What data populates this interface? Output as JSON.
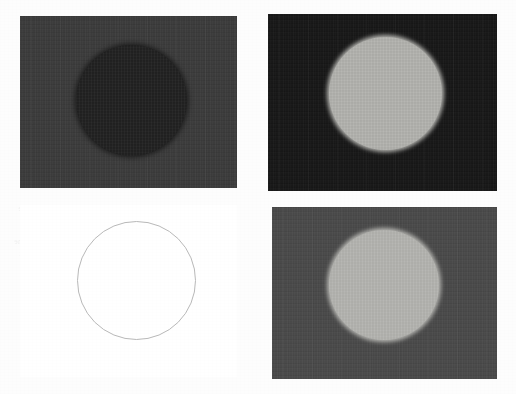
{
  "document": {
    "kind": "scanned-figure-sheet",
    "page_background": "#fdfdfd",
    "width": 516,
    "height": 394,
    "layout": "2x2 panel grid"
  },
  "panels": [
    {
      "id": "top-left",
      "name": "panel-top-left",
      "description": "Dark gray photographic panel containing a darker circular disc",
      "x": 20,
      "y": 16,
      "width": 217,
      "height": 172,
      "background_color": "#3c3c3c",
      "disc": {
        "name": "dark-disc",
        "fill_color": "#232323",
        "cx": 131,
        "cy": 100,
        "diameter": 111,
        "edge": "soft"
      }
    },
    {
      "id": "top-right",
      "name": "panel-top-right",
      "description": "Near-black photographic panel containing a bright light-gray circular disc",
      "x": 268,
      "y": 14,
      "width": 229,
      "height": 177,
      "background_color": "#181818",
      "disc": {
        "name": "light-disc",
        "fill_color": "#b4b4b0",
        "cx": 385,
        "cy": 93,
        "diameter": 113,
        "edge": "soft"
      }
    },
    {
      "id": "bottom-left",
      "name": "panel-bottom-left",
      "description": "Blank white panel containing only a thin gray circle outline",
      "x": 20,
      "y": 205,
      "width": 217,
      "height": 172,
      "background_color": "#ffffff",
      "disc": {
        "name": "circle-outline",
        "stroke_color": "#b9b9b9",
        "stroke_width": 1,
        "fill_color": "transparent",
        "cx": 136,
        "cy": 280,
        "diameter": 119,
        "edge": "thin-outline"
      }
    },
    {
      "id": "bottom-right",
      "name": "panel-bottom-right",
      "description": "Medium-dark gray photographic panel containing a light-gray circular disc",
      "x": 272,
      "y": 207,
      "width": 225,
      "height": 172,
      "background_color": "#4a4a4a",
      "disc": {
        "name": "light-disc",
        "fill_color": "#b6b6b2",
        "cx": 384,
        "cy": 285,
        "diameter": 110,
        "edge": "soft"
      }
    }
  ],
  "bleed_through_text": {
    "name": "verso-bleed-through",
    "note": "Faint mirrored text showing through from the reverse side of the scanned page",
    "mirrored": true,
    "opacity": 0.055,
    "blocks": [
      {
        "id": "bleed-top",
        "x": 18,
        "y": 203,
        "font_size": 9,
        "line_height": 11,
        "lines": [
          "night-time ambient the temperature",
          "under equilibrium and temperature"
        ]
      },
      {
        "id": "bleed-middle",
        "x": 14,
        "y": 236,
        "font_size": 8,
        "line_height": 12,
        "lines": [
          "the surface of the sample and the",
          "measured value of the heat flux",
          "is obtained from the thermal",
          "conductivity of the test piece",
          "at each measured point on the"
        ]
      },
      {
        "id": "bleed-bottom",
        "x": 20,
        "y": 352,
        "font_size": 9,
        "line_height": 12,
        "lines": [
          "total heat transfer rate",
          "for the surface region"
        ]
      }
    ]
  }
}
